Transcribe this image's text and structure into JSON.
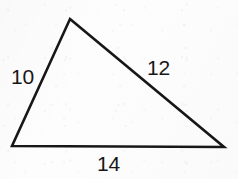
{
  "figure": {
    "kind": "geometry-diagram",
    "shape_name": "triangle",
    "background_color": "#fdfdfd",
    "stroke_color": "#171717",
    "label_color": "#171717",
    "stroke_width": 2.6,
    "canvas": {
      "width": 238,
      "height": 179
    }
  },
  "chart_data": {
    "type": "diagram",
    "title": "",
    "shape": "triangle",
    "vertices": [
      {
        "name": "apex",
        "x": 70,
        "y": 19
      },
      {
        "name": "bottom-left",
        "x": 12,
        "y": 146
      },
      {
        "name": "bottom-right",
        "x": 224,
        "y": 147
      }
    ],
    "sides": [
      {
        "name": "left-side",
        "from": "bottom-left",
        "to": "apex",
        "label": "10"
      },
      {
        "name": "right-side",
        "from": "apex",
        "to": "bottom-right",
        "label": "12"
      },
      {
        "name": "bottom-side",
        "from": "bottom-left",
        "to": "bottom-right",
        "label": "14"
      }
    ],
    "labels": [
      "10",
      "12",
      "14"
    ]
  },
  "labels": {
    "left": "10",
    "right": "12",
    "bottom": "14"
  }
}
